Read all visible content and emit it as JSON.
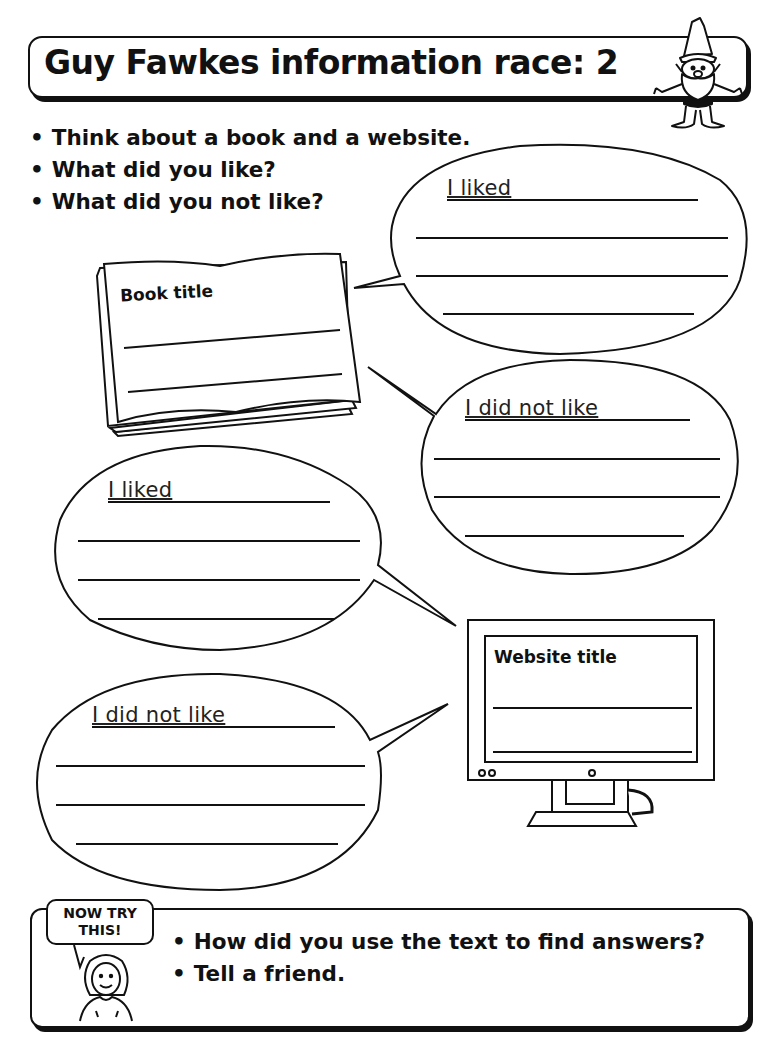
{
  "header": {
    "title": "Guy Fawkes information race: 2",
    "mascot_icon": "gnome-icon"
  },
  "instructions": [
    "Think about a book and a website.",
    "What did you like?",
    "What did you not like?"
  ],
  "book": {
    "label": "Book title",
    "lines": 2,
    "icon": "open-book-icon"
  },
  "website": {
    "label": "Website title",
    "lines": 2,
    "icon": "computer-monitor-icon"
  },
  "bubbles": {
    "book_liked": {
      "label": "I liked",
      "lines": 4
    },
    "book_not_liked": {
      "label": "I did not like",
      "lines": 4
    },
    "web_liked": {
      "label": "I liked",
      "lines": 4
    },
    "web_not_liked": {
      "label": "I did not like",
      "lines": 4
    }
  },
  "now_try_this": {
    "badge": "NOW TRY THIS!",
    "badge_line1": "NOW TRY",
    "badge_line2": "THIS!",
    "mascot_icon": "girl-icon",
    "items": [
      "How did you use the text to find answers?",
      "Tell a friend."
    ]
  }
}
